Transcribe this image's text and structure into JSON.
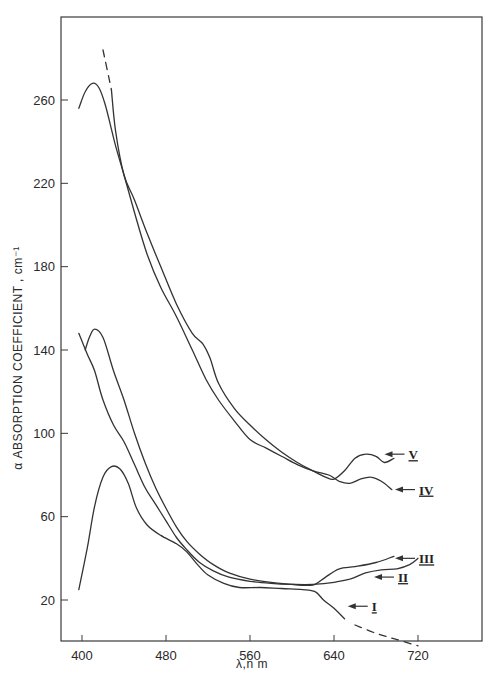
{
  "chart_data": {
    "type": "line",
    "title": "",
    "xlabel": "λ,n m",
    "ylabel": "α ABSORPTION COEFFICIENT, cm⁻¹",
    "xlim": [
      380,
      780
    ],
    "ylim": [
      0,
      300
    ],
    "x_ticks": [
      400,
      480,
      560,
      640,
      720
    ],
    "y_ticks": [
      20,
      60,
      100,
      140,
      180,
      220,
      260
    ],
    "grid": false,
    "legend": "inline labels with arrows",
    "series": [
      {
        "name": "I",
        "points": [
          [
            397,
            25
          ],
          [
            405,
            45
          ],
          [
            412,
            65
          ],
          [
            420,
            79
          ],
          [
            428,
            84
          ],
          [
            436,
            83
          ],
          [
            444,
            76
          ],
          [
            452,
            64
          ],
          [
            462,
            56
          ],
          [
            475,
            51
          ],
          [
            490,
            47
          ],
          [
            500,
            43
          ],
          [
            510,
            37
          ],
          [
            520,
            32
          ],
          [
            535,
            28
          ],
          [
            550,
            26
          ],
          [
            570,
            26
          ],
          [
            590,
            25.5
          ],
          [
            610,
            25
          ],
          [
            622,
            24
          ],
          [
            630,
            20
          ],
          [
            640,
            16
          ],
          [
            650,
            11
          ]
        ],
        "dashed_extension": [
          [
            660,
            8
          ],
          [
            680,
            4
          ],
          [
            700,
            1
          ],
          [
            720,
            -2
          ]
        ],
        "label_point": [
          655,
          17
        ]
      },
      {
        "name": "II",
        "points": [
          [
            397,
            148
          ],
          [
            405,
            138
          ],
          [
            412,
            130
          ],
          [
            420,
            116
          ],
          [
            430,
            104
          ],
          [
            440,
            96
          ],
          [
            450,
            85
          ],
          [
            460,
            74
          ],
          [
            470,
            66
          ],
          [
            480,
            58
          ],
          [
            490,
            50
          ],
          [
            500,
            44
          ],
          [
            512,
            38
          ],
          [
            525,
            34
          ],
          [
            540,
            31
          ],
          [
            560,
            29
          ],
          [
            580,
            28
          ],
          [
            600,
            27.5
          ],
          [
            620,
            27.5
          ],
          [
            640,
            28.5
          ],
          [
            655,
            30
          ],
          [
            670,
            33
          ],
          [
            685,
            34.5
          ],
          [
            700,
            35
          ],
          [
            712,
            37
          ],
          [
            720,
            40
          ]
        ],
        "label_point": [
          680,
          31
        ]
      },
      {
        "name": "III",
        "points": [
          [
            403,
            140
          ],
          [
            407,
            146
          ],
          [
            412,
            150
          ],
          [
            420,
            146
          ],
          [
            430,
            130
          ],
          [
            440,
            116
          ],
          [
            450,
            100
          ],
          [
            460,
            86
          ],
          [
            470,
            74
          ],
          [
            480,
            64
          ],
          [
            490,
            55
          ],
          [
            500,
            48
          ],
          [
            512,
            42
          ],
          [
            525,
            37
          ],
          [
            540,
            33
          ],
          [
            560,
            30
          ],
          [
            580,
            28.5
          ],
          [
            600,
            27.5
          ],
          [
            615,
            27
          ],
          [
            622,
            27.5
          ],
          [
            632,
            31
          ],
          [
            645,
            35
          ],
          [
            660,
            36
          ],
          [
            680,
            38
          ],
          [
            697,
            41
          ]
        ],
        "label_point": [
          700,
          40
        ]
      },
      {
        "name": "IV",
        "points": [
          [
            397,
            256
          ],
          [
            403,
            264
          ],
          [
            410,
            268
          ],
          [
            416,
            266
          ],
          [
            422,
            258
          ],
          [
            428,
            246
          ],
          [
            432,
            238
          ],
          [
            440,
            224
          ],
          [
            450,
            206
          ],
          [
            462,
            186
          ],
          [
            475,
            170
          ],
          [
            490,
            156
          ],
          [
            505,
            140
          ],
          [
            518,
            126
          ],
          [
            530,
            116
          ],
          [
            545,
            106
          ],
          [
            560,
            97
          ],
          [
            575,
            93
          ],
          [
            590,
            89
          ],
          [
            605,
            85
          ],
          [
            620,
            82
          ],
          [
            635,
            80
          ],
          [
            645,
            77
          ],
          [
            655,
            76
          ],
          [
            665,
            78
          ],
          [
            675,
            79
          ],
          [
            685,
            77
          ],
          [
            695,
            73
          ]
        ],
        "label_point": [
          700,
          73
        ]
      },
      {
        "name": "V",
        "points": [
          [
            428,
            265
          ],
          [
            432,
            245
          ],
          [
            440,
            224
          ],
          [
            450,
            212
          ],
          [
            462,
            196
          ],
          [
            475,
            180
          ],
          [
            490,
            162
          ],
          [
            505,
            148
          ],
          [
            515,
            143
          ],
          [
            522,
            136
          ],
          [
            530,
            124
          ],
          [
            545,
            112
          ],
          [
            560,
            104
          ],
          [
            575,
            97
          ],
          [
            590,
            91
          ],
          [
            605,
            86
          ],
          [
            620,
            82
          ],
          [
            632,
            79
          ],
          [
            640,
            78
          ],
          [
            650,
            82
          ],
          [
            660,
            88
          ],
          [
            670,
            90
          ],
          [
            680,
            89
          ],
          [
            688,
            86
          ],
          [
            697,
            88
          ]
        ],
        "dashed_extension": [
          [
            420,
            284
          ],
          [
            428,
            265
          ]
        ],
        "label_point": [
          690,
          90
        ]
      }
    ]
  },
  "axes": {
    "x_tick_labels": [
      "400",
      "480",
      "560",
      "640",
      "720"
    ],
    "y_tick_labels": [
      "20",
      "60",
      "100",
      "140",
      "180",
      "220",
      "260"
    ],
    "xlabel": "λ,n m",
    "ylabel": "α  ABSORPTION   COEFFICIENT , cm⁻¹"
  },
  "labels": {
    "I": "I",
    "II": "II",
    "III": "III",
    "IV": "IV",
    "V": "V"
  },
  "colors": {
    "ink": "#333333",
    "background": "#ffffff"
  }
}
